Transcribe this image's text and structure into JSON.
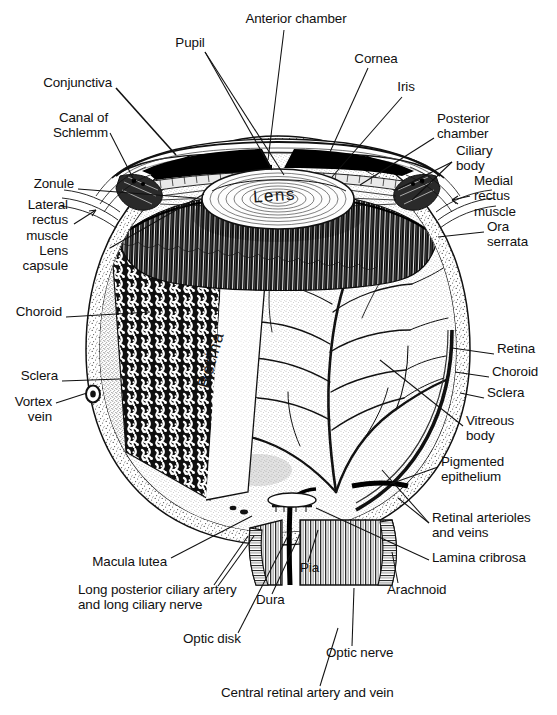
{
  "figure": {
    "style": "engraved line-and-stipple anatomical illustration, black ink on white",
    "background_color": "#ffffff",
    "ink_color": "#101010"
  },
  "inline_labels": [
    {
      "name": "lens",
      "text": "Lens",
      "x": 281,
      "y": 196,
      "rotation": -4
    },
    {
      "name": "retina",
      "text": "Retina",
      "x": 212,
      "y": 365,
      "rotation": -74
    }
  ],
  "labels": [
    {
      "name": "anterior-chamber",
      "text": "Anterior chamber",
      "x": 296,
      "y": 18,
      "align": "center"
    },
    {
      "name": "pupil",
      "text": "Pupil",
      "x": 190,
      "y": 42,
      "align": "center"
    },
    {
      "name": "cornea",
      "text": "Cornea",
      "x": 376,
      "y": 58,
      "align": "center"
    },
    {
      "name": "iris",
      "text": "Iris",
      "x": 406,
      "y": 86,
      "align": "center"
    },
    {
      "name": "conjunctiva",
      "text": "Conjunctiva",
      "x": 112,
      "y": 82,
      "align": "right"
    },
    {
      "name": "canal-of-schlemm",
      "text": "Canal of\nSchlemm",
      "x": 108,
      "y": 117,
      "align": "right"
    },
    {
      "name": "posterior-chamber",
      "text": "Posterior\nchamber",
      "x": 437,
      "y": 118,
      "align": "left"
    },
    {
      "name": "ciliary-body",
      "text": "Ciliary\nbody",
      "x": 456,
      "y": 150,
      "align": "left"
    },
    {
      "name": "zonule",
      "text": "Zonule",
      "x": 74,
      "y": 183,
      "align": "right"
    },
    {
      "name": "medial-rectus-muscle",
      "text": "Medial\nrectus\nmuscle",
      "x": 474,
      "y": 180,
      "align": "left"
    },
    {
      "name": "lateral-rectus-muscle",
      "text": "Lateral\nrectus\nmuscle",
      "x": 68,
      "y": 204,
      "align": "right"
    },
    {
      "name": "ora-serrata",
      "text": "Ora\nserrata",
      "x": 487,
      "y": 226,
      "align": "left"
    },
    {
      "name": "lens-capsule",
      "text": "Lens\ncapsule",
      "x": 68,
      "y": 250,
      "align": "right"
    },
    {
      "name": "choroid-left",
      "text": "Choroid",
      "x": 62,
      "y": 311,
      "align": "right"
    },
    {
      "name": "sclera-left",
      "text": "Sclera",
      "x": 58,
      "y": 375,
      "align": "right"
    },
    {
      "name": "vortex-vein",
      "text": "Vortex\nvein",
      "x": 52,
      "y": 401,
      "align": "right"
    },
    {
      "name": "retina-right",
      "text": "Retina",
      "x": 497,
      "y": 348,
      "align": "left"
    },
    {
      "name": "choroid-right",
      "text": "Choroid",
      "x": 492,
      "y": 371,
      "align": "left"
    },
    {
      "name": "sclera-right",
      "text": "Sclera",
      "x": 487,
      "y": 392,
      "align": "left"
    },
    {
      "name": "vitreous-body",
      "text": "Vitreous\nbody",
      "x": 466,
      "y": 420,
      "align": "left"
    },
    {
      "name": "pigmented-epithelium",
      "text": "Pigmented\nepithelium",
      "x": 441,
      "y": 461,
      "align": "left"
    },
    {
      "name": "retinal-arterioles-and-veins",
      "text": "Retinal arterioles\nand veins",
      "x": 432,
      "y": 517,
      "align": "left"
    },
    {
      "name": "lamina-cribrosa",
      "text": "Lamina cribrosa",
      "x": 432,
      "y": 557,
      "align": "left"
    },
    {
      "name": "arachnoid",
      "text": "Arachnoid",
      "x": 387,
      "y": 589,
      "align": "left"
    },
    {
      "name": "macula-lutea",
      "text": "Macula lutea",
      "x": 167,
      "y": 561,
      "align": "right"
    },
    {
      "name": "long-posterior-ciliary-artery",
      "text": "Long posterior ciliary artery\nand long ciliary nerve",
      "x": 78,
      "y": 589,
      "align": "left"
    },
    {
      "name": "pia",
      "text": "Pia",
      "x": 300,
      "y": 567,
      "align": "left"
    },
    {
      "name": "dura",
      "text": "Dura",
      "x": 256,
      "y": 599,
      "align": "left"
    },
    {
      "name": "optic-disk",
      "text": "Optic disk",
      "x": 183,
      "y": 638,
      "align": "left"
    },
    {
      "name": "optic-nerve",
      "text": "Optic nerve",
      "x": 326,
      "y": 652,
      "align": "left"
    },
    {
      "name": "central-retinal-artery-and-vein",
      "text": "Central retinal artery and vein",
      "x": 221,
      "y": 692,
      "align": "left"
    }
  ],
  "structures": [
    "sclera",
    "choroid",
    "retina",
    "cornea",
    "iris",
    "pupil",
    "lens",
    "lens capsule",
    "zonule",
    "ciliary body",
    "ora serrata",
    "anterior chamber",
    "posterior chamber",
    "vitreous body",
    "canal of Schlemm",
    "conjunctiva",
    "vortex vein",
    "pigmented epithelium",
    "optic disk",
    "optic nerve",
    "lamina cribrosa",
    "dura",
    "arachnoid",
    "pia",
    "macula lutea",
    "medial rectus muscle",
    "lateral rectus muscle",
    "central retinal artery and vein",
    "retinal arterioles and veins",
    "long posterior ciliary artery and long ciliary nerve"
  ]
}
